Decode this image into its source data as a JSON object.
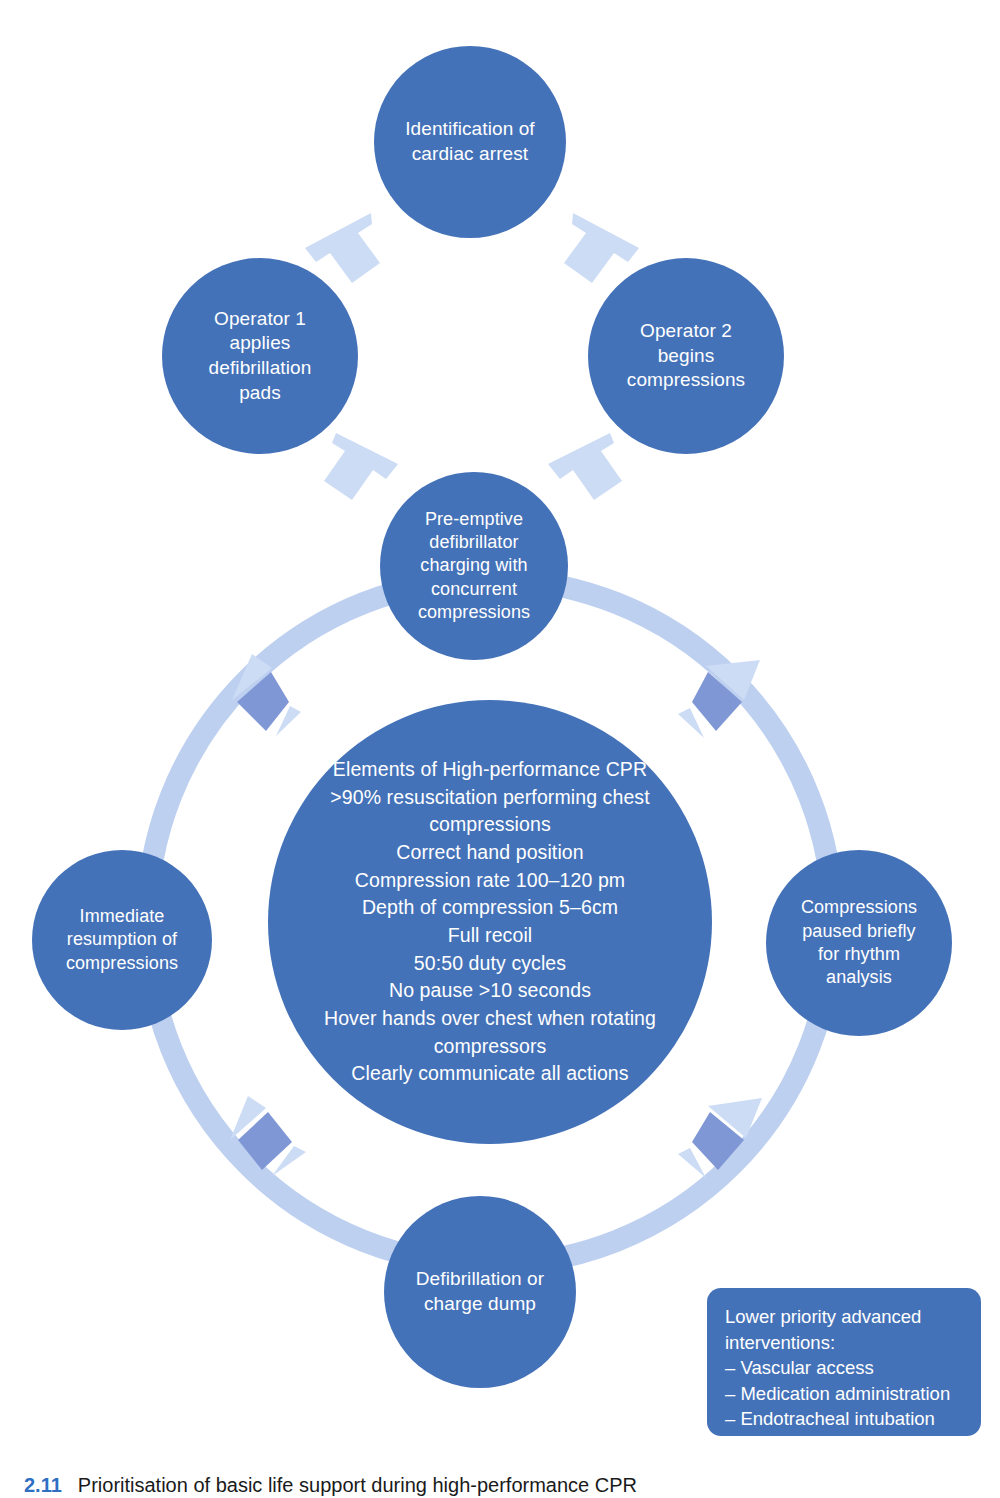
{
  "colors": {
    "node_fill": "#4472b8",
    "ring_fill": "#b9cdf0",
    "arrow_marker": "#8097d6",
    "chevron": "#cddcf5",
    "text_on_node": "#ffffff",
    "caption_number": "#2e6fc4",
    "background": "#ffffff"
  },
  "nodes": {
    "identification": "Identification of\ncardiac arrest",
    "operator1": "Operator 1\napplies\ndefibrillation\npads",
    "operator2": "Operator 2\nbegins\ncompressions",
    "preemptive": "Pre-emptive\ndefibrillator\ncharging with\nconcurrent\ncompressions",
    "immediate": "Immediate\nresumption of\ncompressions",
    "paused": "Compressions\npaused briefly\nfor rhythm\nanalysis",
    "defibrillation": "Defibrillation or\ncharge dump",
    "center": "Elements of High-performance CPR\n>90% resuscitation performing chest\ncompressions\nCorrect hand position\nCompression rate 100–120 pm\nDepth of compression 5–6cm\nFull recoil\n50:50 duty cycles\nNo pause >10 seconds\nHover hands over chest when rotating\ncompressors\nClearly communicate all actions"
  },
  "center_lines": [
    "Elements of High-performance CPR",
    ">90% resuscitation performing chest",
    "compressions",
    "Correct hand position",
    "Compression rate 100–120 pm",
    "Depth of compression 5–6cm",
    "Full recoil",
    "50:50 duty cycles",
    "No pause >10 seconds",
    "Hover hands over chest when rotating",
    "compressors",
    "Clearly communicate all actions"
  ],
  "legend": {
    "title_line1": "Lower priority advanced",
    "title_line2": "interventions:",
    "item1": "– Vascular access",
    "item2": "– Medication administration",
    "item3": "– Endotracheal intubation"
  },
  "caption": {
    "number": "2.11",
    "text": "Prioritisation of basic life support during high-performance CPR"
  }
}
